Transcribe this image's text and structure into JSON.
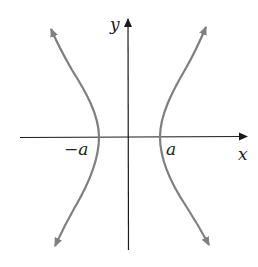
{
  "figure": {
    "type": "hyperbola",
    "equation_form": "x^2/a^2 - y^2/b^2 = 1",
    "axes": {
      "x_label": "x",
      "y_label": "y"
    },
    "vertex_labels": {
      "left": "−a",
      "right": "a"
    },
    "colors": {
      "curve": "#7f7f7f",
      "axis": "#1a1a1a",
      "background": "#ffffff"
    }
  }
}
